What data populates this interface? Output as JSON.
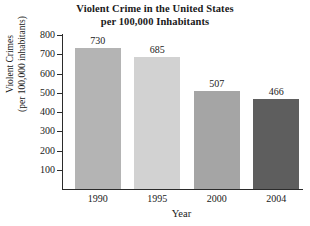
{
  "chart_data": {
    "type": "bar",
    "title": "Violent Crime in the United States per 100,000 Inhabitants",
    "title_lines": [
      "Violent Crime in the United States",
      "per 100,000 Inhabitants"
    ],
    "categories": [
      "1990",
      "1995",
      "2000",
      "2004"
    ],
    "values": [
      730,
      685,
      507,
      466
    ],
    "xlabel": "Year",
    "ylabel": "Violent Crimes (per 100,000 inhabitants)",
    "ylabel_lines": [
      "Violent Crimes",
      "(per 100,000 inhabitants)"
    ],
    "ylim": [
      0,
      800
    ],
    "yticks": [
      100,
      200,
      300,
      400,
      500,
      600,
      700,
      800
    ],
    "ytick_labels": [
      "100",
      "200",
      "300",
      "400",
      "500",
      "600",
      "700",
      "800"
    ],
    "grid": false,
    "legend": false,
    "bar_colors": [
      "#b4b4b4",
      "#d2d2d2",
      "#a5a5a5",
      "#5e5e5e"
    ],
    "data_labels": [
      "730",
      "685",
      "507",
      "466"
    ],
    "axis_color": "#2b2b2b",
    "background": "#ffffff"
  }
}
